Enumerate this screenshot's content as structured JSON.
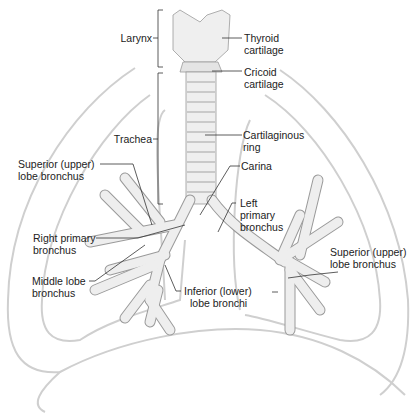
{
  "diagram": {
    "colors": {
      "outline": "#c8c8c8",
      "airway_fill": "#eeeeee",
      "airway_stroke": "#9a9a9a",
      "leader_line": "#333333",
      "text": "#222222"
    },
    "labels": {
      "larynx": "Larynx",
      "thyroid_cartilage_1": "Thyroid",
      "thyroid_cartilage_2": "cartilage",
      "cricoid_cartilage_1": "Cricoid",
      "cricoid_cartilage_2": "cartilage",
      "trachea": "Trachea",
      "cartilaginous_ring_1": "Cartilaginous",
      "cartilaginous_ring_2": "ring",
      "carina": "Carina",
      "superior_lobe_bronchus_right_1": "Superior (upper)",
      "superior_lobe_bronchus_right_2": "lobe bronchus",
      "left_primary_bronchus_1": "Left",
      "left_primary_bronchus_2": "primary",
      "left_primary_bronchus_3": "bronchus",
      "right_primary_bronchus_1": "Right primary",
      "right_primary_bronchus_2": "bronchus",
      "superior_lobe_bronchus_left_1": "Superior (upper)",
      "superior_lobe_bronchus_left_2": "lobe bronchus",
      "inferior_lobe_bronchi_1": "Inferior (lower)",
      "inferior_lobe_bronchi_2": "lobe bronchi",
      "middle_lobe_bronchus_1": "Middle lobe",
      "middle_lobe_bronchus_2": "bronchus"
    }
  }
}
